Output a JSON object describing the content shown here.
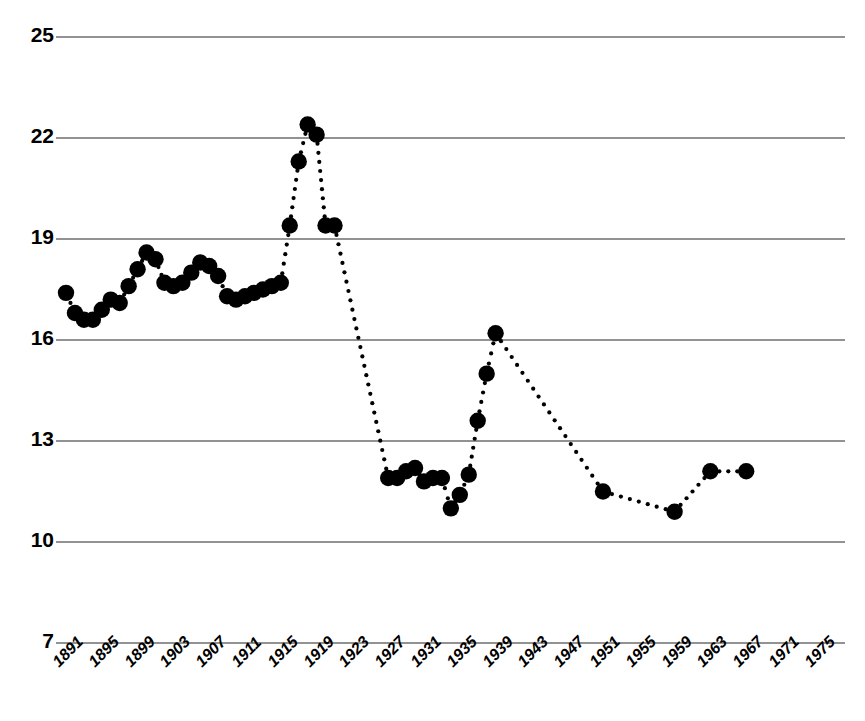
{
  "chart_data": {
    "type": "scatter",
    "title": "",
    "subtitle": "",
    "xlabel": "",
    "ylabel": "",
    "xlim": [
      1891,
      1975
    ],
    "ylim": [
      7,
      25
    ],
    "grid": true,
    "legend": null,
    "marker_color": "#000000",
    "gridline_color": "#6e6e6e",
    "background_color": "#ffffff",
    "x_tick_labels": [
      "1891",
      "1895",
      "1899",
      "1903",
      "1907",
      "1911",
      "1915",
      "1919",
      "1923",
      "1927",
      "1931",
      "1935",
      "1939",
      "1943",
      "1947",
      "1951",
      "1955",
      "1959",
      "1963",
      "1967",
      "1971",
      "1975"
    ],
    "x_tick_values": [
      1891,
      1895,
      1899,
      1903,
      1907,
      1911,
      1915,
      1919,
      1923,
      1927,
      1931,
      1935,
      1939,
      1943,
      1947,
      1951,
      1955,
      1959,
      1963,
      1967,
      1971,
      1975
    ],
    "y_tick_labels": [
      "25",
      "22",
      "19",
      "16",
      "13",
      "10",
      "7"
    ],
    "y_tick_values": [
      25,
      22,
      19,
      16,
      13,
      10,
      7
    ],
    "x": [
      1891,
      1892,
      1893,
      1894,
      1895,
      1896,
      1897,
      1898,
      1899,
      1900,
      1901,
      1902,
      1903,
      1904,
      1905,
      1906,
      1907,
      1908,
      1909,
      1910,
      1911,
      1912,
      1913,
      1914,
      1915,
      1916,
      1917,
      1918,
      1919,
      1920,
      1921,
      1927,
      1928,
      1929,
      1930,
      1931,
      1932,
      1933,
      1934,
      1935,
      1936,
      1937,
      1938,
      1939,
      1951,
      1959,
      1963,
      1967
    ],
    "values": [
      17.4,
      16.8,
      16.6,
      16.6,
      16.9,
      17.2,
      17.1,
      17.6,
      18.1,
      18.6,
      18.4,
      17.7,
      17.6,
      17.7,
      18.0,
      18.3,
      18.2,
      17.9,
      17.3,
      17.2,
      17.3,
      17.4,
      17.5,
      17.6,
      17.7,
      19.4,
      21.3,
      22.4,
      22.1,
      19.4,
      19.4,
      11.9,
      11.9,
      12.1,
      12.2,
      11.8,
      11.9,
      11.9,
      11.0,
      11.4,
      12.0,
      13.6,
      15.0,
      16.2,
      11.5,
      10.9,
      12.1,
      12.1
    ]
  },
  "axes": {
    "y_label_texts": [
      "25",
      "22",
      "19",
      "16",
      "13",
      "10",
      "7"
    ]
  }
}
